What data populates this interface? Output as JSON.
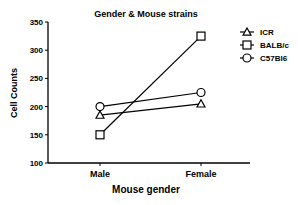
{
  "chart_data": {
    "type": "line",
    "title": "Gender & Mouse strains",
    "xlabel": "Mouse gender",
    "ylabel": "Cell Counts",
    "categories": [
      "Male",
      "Female"
    ],
    "ylim": [
      100,
      350
    ],
    "yticks": [
      100,
      150,
      200,
      250,
      300,
      350
    ],
    "grid": false,
    "legend_position": "right",
    "series": [
      {
        "name": "ICR",
        "marker": "triangle",
        "values": [
          185,
          205
        ]
      },
      {
        "name": "BALB/c",
        "marker": "square",
        "values": [
          150,
          325
        ]
      },
      {
        "name": "C57Bl6",
        "marker": "circle",
        "values": [
          200,
          225
        ]
      }
    ]
  },
  "colors": {
    "line": "#000000",
    "background": "#ffffff"
  }
}
